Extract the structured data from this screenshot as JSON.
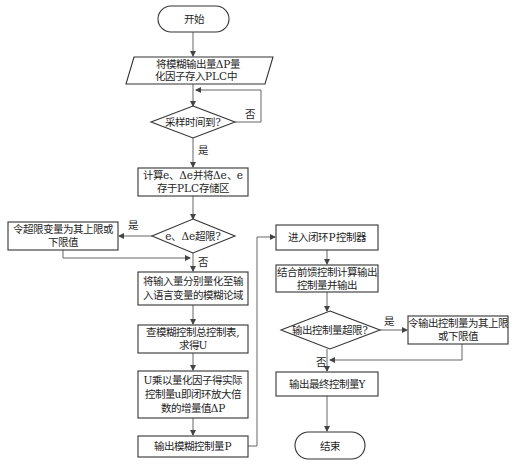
{
  "flowchart": {
    "nodes": {
      "start": {
        "type": "terminal",
        "lines": [
          "开始"
        ]
      },
      "store_factor": {
        "type": "io",
        "lines": [
          "将模糊输出量ΔP量",
          "化因子存入PLC中"
        ]
      },
      "sample_time": {
        "type": "decision",
        "lines": [
          "采样时间到?"
        ]
      },
      "compute_e": {
        "type": "process",
        "lines": [
          "计算e、Δe并将Δe、e",
          "存于PLC存储区"
        ]
      },
      "e_over_limit": {
        "type": "decision",
        "lines": [
          "e、Δe超限?"
        ]
      },
      "set_limit_var": {
        "type": "process",
        "lines": [
          "令超限变量为其上限或",
          "下限值"
        ]
      },
      "quantize": {
        "type": "process",
        "lines": [
          "将输入量分别量化至输",
          "入语言变量的模糊论域"
        ]
      },
      "lookup_table": {
        "type": "process",
        "lines": [
          "查模糊控制总控制表,",
          "求得U"
        ]
      },
      "multiply": {
        "type": "process",
        "lines": [
          "U乘以量化因子得实际",
          "控制量u即闭环放大倍",
          "数的增量值ΔP"
        ]
      },
      "output_fuzzy": {
        "type": "process",
        "lines": [
          "输出模糊控制量P"
        ]
      },
      "enter_p": {
        "type": "process",
        "lines": [
          "进入闭环P控制器"
        ]
      },
      "feedforward": {
        "type": "process",
        "lines": [
          "结合前馈控制计算输出",
          "控制量并输出"
        ]
      },
      "output_over_limit": {
        "type": "decision",
        "lines": [
          "输出控制量超限?"
        ]
      },
      "set_output_limit": {
        "type": "process",
        "lines": [
          "令输出控制量为其上限",
          "或下限值"
        ]
      },
      "output_final": {
        "type": "process",
        "lines": [
          "输出最终控制量Y"
        ]
      },
      "end": {
        "type": "terminal",
        "lines": [
          "结束"
        ]
      }
    },
    "edge_labels": {
      "sample_no": "否",
      "sample_yes": "是",
      "e_yes": "是",
      "e_no": "否",
      "out_yes": "是",
      "out_no": "否"
    },
    "colors": {
      "stroke": "#333333",
      "line": "#555555",
      "fill": "#ffffff",
      "text": "#1e1e1e"
    }
  }
}
